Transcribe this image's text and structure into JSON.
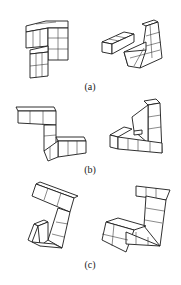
{
  "figure": {
    "type": "mental-rotation-stimuli",
    "rows": [
      {
        "id": "a",
        "label": "(a)",
        "left_shape": "cube-figure-a-left",
        "right_shape": "cube-figure-a-right"
      },
      {
        "id": "b",
        "label": "(b)",
        "left_shape": "cube-figure-b-left",
        "right_shape": "cube-figure-b-right"
      },
      {
        "id": "c",
        "label": "(c)",
        "left_shape": "cube-figure-c-left",
        "right_shape": "cube-figure-c-right"
      }
    ],
    "colors": {
      "background": "#ffffff",
      "stroke": "#1a1a1a"
    }
  }
}
